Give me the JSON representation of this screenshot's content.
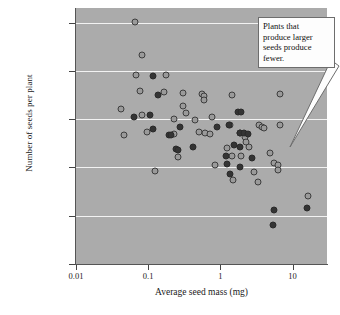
{
  "chart_data": {
    "type": "scatter",
    "title": "",
    "xlabel": "Average seed mass (mg)",
    "ylabel": "Number of seeds per plant",
    "xscale": "log",
    "yscale": "log",
    "xlim": [
      0.01,
      30
    ],
    "ylim": [
      10,
      2000000
    ],
    "grid": true,
    "legend": "none",
    "xticks": [
      "0.01",
      "0.1",
      "1",
      "10"
    ],
    "xtick_values": [
      0.01,
      0.1,
      1,
      10
    ],
    "yticks": [
      "10",
      "100",
      "1,000",
      "10,000",
      "100,000",
      "1,000,000"
    ],
    "ytick_values": [
      10,
      100,
      1000,
      10000,
      100000,
      1000000
    ],
    "annotations": [
      {
        "text": "Plants that produce larger seeds produce fewer.",
        "lines": [
          "Plants that",
          "produce larger",
          "seeds produce",
          "fewer."
        ],
        "points_to_x": 3.2,
        "points_to_y": 2600
      }
    ],
    "series": [
      {
        "name": "light",
        "marker": "open-gray-circle",
        "color": "#9a9a9a",
        "edge_color": "#3d3d3d",
        "points": [
          [
            0.065,
            1050000
          ],
          [
            0.083,
            215000
          ],
          [
            0.068,
            83000
          ],
          [
            0.175,
            82000
          ],
          [
            0.077,
            39000
          ],
          [
            0.165,
            37000
          ],
          [
            0.305,
            35000
          ],
          [
            0.56,
            33000
          ],
          [
            0.6,
            30000
          ],
          [
            0.585,
            25000
          ],
          [
            1.45,
            32000
          ],
          [
            6.6,
            33000
          ],
          [
            0.042,
            16000
          ],
          [
            0.3,
            19000
          ],
          [
            0.082,
            12000
          ],
          [
            0.33,
            13500
          ],
          [
            0.225,
            9900
          ],
          [
            0.44,
            9400
          ],
          [
            0.77,
            11200
          ],
          [
            0.046,
            4700
          ],
          [
            0.095,
            5400
          ],
          [
            0.225,
            5000
          ],
          [
            0.5,
            5300
          ],
          [
            0.62,
            5200
          ],
          [
            0.72,
            4900
          ],
          [
            1.35,
            7600
          ],
          [
            3.4,
            7600
          ],
          [
            3.8,
            6900
          ],
          [
            4.0,
            6600
          ],
          [
            6.6,
            7500
          ],
          [
            2.2,
            4200
          ],
          [
            2.25,
            3300
          ],
          [
            1.25,
            2500
          ],
          [
            2.5,
            2600
          ],
          [
            0.26,
            1650
          ],
          [
            1.45,
            1700
          ],
          [
            1.95,
            1750
          ],
          [
            4.9,
            1950
          ],
          [
            5.6,
            1250
          ],
          [
            6.2,
            1100
          ],
          [
            6.3,
            900
          ],
          [
            0.125,
            860
          ],
          [
            0.85,
            1100
          ],
          [
            2.9,
            800
          ],
          [
            3.3,
            510
          ],
          [
            1.5,
            540
          ],
          [
            16.5,
            260
          ]
        ]
      },
      {
        "name": "dark",
        "marker": "filled-dark-circle",
        "color": "#343434",
        "edge_color": "#2a2a2a",
        "points": [
          [
            0.115,
            78000
          ],
          [
            0.135,
            31000
          ],
          [
            0.105,
            12000
          ],
          [
            0.063,
            11000
          ],
          [
            1.75,
            13800
          ],
          [
            1.95,
            14200
          ],
          [
            0.115,
            6100
          ],
          [
            0.195,
            4800
          ],
          [
            0.205,
            4700
          ],
          [
            0.275,
            6800
          ],
          [
            0.9,
            7000
          ],
          [
            1.3,
            7600
          ],
          [
            1.85,
            5200
          ],
          [
            1.9,
            5100
          ],
          [
            2.15,
            5200
          ],
          [
            2.45,
            4900
          ],
          [
            0.245,
            2450
          ],
          [
            0.255,
            2250
          ],
          [
            0.42,
            2600
          ],
          [
            1.55,
            2900
          ],
          [
            1.9,
            2700
          ],
          [
            2.75,
            1600
          ],
          [
            1.25,
            1150
          ],
          [
            1.2,
            1700
          ],
          [
            1.85,
            1000
          ],
          [
            1.35,
            720
          ],
          [
            5.5,
            130
          ],
          [
            5.4,
            65
          ],
          [
            16.0,
            145
          ]
        ]
      }
    ]
  },
  "caption": {
    "text": ""
  }
}
